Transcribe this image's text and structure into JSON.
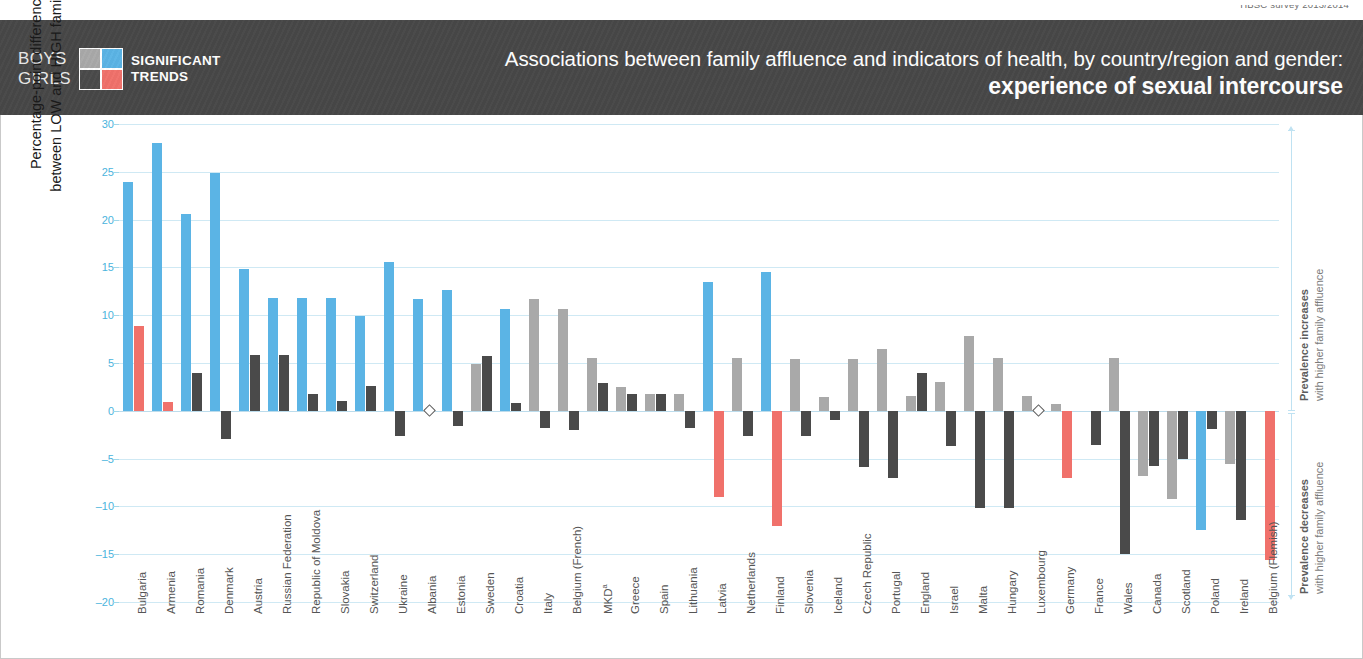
{
  "source": {
    "text": "HBSC survey 2013/2014"
  },
  "header": {
    "legend": {
      "gender_top": "BOYS",
      "gender_bottom": "GIRLS",
      "caption_line1": "SIGNIFICANT",
      "caption_line2": "TRENDS",
      "swatch": {
        "boys_nonsignificant": "#A9A9A9",
        "boys_significant": "#5BB4E5",
        "girls_nonsignificant": "#4A4A4A",
        "girls_significant": "#F0716B"
      }
    },
    "title_line1": "Associations between family affluence and indicators of health, by country/region and gender:",
    "title_line2": "experience of sexual intercourse",
    "background": "#474747"
  },
  "yaxis": {
    "title_line1": "Percentage-point difference in prevalence",
    "title_line2": "between LOW and HIGH family affluence groups",
    "ticks": [
      30,
      25,
      20,
      15,
      10,
      5,
      0,
      -5,
      -10,
      -15,
      -20
    ],
    "tick_labels": [
      "30",
      "25",
      "20",
      "15",
      "10",
      "5",
      "0",
      "–5",
      "–10",
      "–15",
      "–20"
    ],
    "min": -20,
    "max": 30,
    "tick_color": "#4BB4DD"
  },
  "annotations": {
    "increase": {
      "bold": "Prevalence increases",
      "rest": "with higher family affluence"
    },
    "decrease": {
      "bold": "Prevalence decreases",
      "rest": "with higher family affluence"
    }
  },
  "chart_data": {
    "type": "bar",
    "title": "Associations between family affluence and indicators of health, by country/region and gender: experience of sexual intercourse",
    "xlabel": "",
    "ylabel": "Percentage-point difference in prevalence between LOW and HIGH family affluence groups",
    "ylim": [
      -20,
      30
    ],
    "ytick_step": 5,
    "grid": true,
    "legend_position": "header-left",
    "colors": {
      "boys_significant": "#5BB4E5",
      "boys_nonsignificant": "#A9A9A9",
      "girls_significant": "#F0716B",
      "girls_nonsignificant": "#4A4A4A"
    },
    "categories": [
      "Bulgaria",
      "Armenia",
      "Romania",
      "Denmark",
      "Austria",
      "Russian Federation",
      "Republic of Moldova",
      "Slovakia",
      "Switzerland",
      "Ukraine",
      "Albania",
      "Estonia",
      "Sweden",
      "Croatia",
      "Italy",
      "Belgium (French)",
      "MKD",
      "Greece",
      "Spain",
      "Lithuania",
      "Latvia",
      "Netherlands",
      "Finland",
      "Slovenia",
      "Iceland",
      "Czech Republic",
      "Portugal",
      "England",
      "Israel",
      "Malta",
      "Hungary",
      "Luxembourg",
      "Germany",
      "France",
      "Wales",
      "Canada",
      "Scotland",
      "Poland",
      "Ireland",
      "Belgium (Flemish)"
    ],
    "series": [
      {
        "name": "Boys",
        "values": [
          23.9,
          28.0,
          20.6,
          24.9,
          14.8,
          11.8,
          11.8,
          11.8,
          9.9,
          15.6,
          11.7,
          12.6,
          4.9,
          10.6,
          11.7,
          10.6,
          5.5,
          2.5,
          1.8,
          1.8,
          13.5,
          5.5,
          14.5,
          5.4,
          1.4,
          5.4,
          6.5,
          1.5,
          3.0,
          7.8,
          5.5,
          1.5,
          0.7,
          0.0,
          5.5,
          0.0,
          0.0,
          0.0,
          0.0,
          0.0
        ],
        "significance": [
          "sig",
          "sig",
          "sig",
          "sig",
          "sig",
          "sig",
          "sig",
          "sig",
          "sig",
          "sig",
          "sig",
          "sig",
          "ns",
          "sig",
          "ns",
          "ns",
          "ns",
          "ns",
          "ns",
          "ns",
          "sig",
          "ns",
          "sig",
          "ns",
          "ns",
          "ns",
          "ns",
          "ns",
          "ns",
          "ns",
          "ns",
          "ns",
          "ns",
          "ns",
          "ns",
          "ns",
          "ns",
          "ns",
          "ns",
          "ns"
        ]
      },
      {
        "name": "Boys negative",
        "values": [
          0,
          0,
          0,
          0,
          0,
          0,
          0,
          0,
          0,
          0,
          0,
          0,
          0,
          0,
          0,
          0,
          0,
          0,
          0,
          0,
          0,
          0,
          0,
          0,
          0,
          0,
          -5.0,
          -6.5,
          0,
          0,
          0,
          -6.5,
          0,
          0,
          0,
          -6.8,
          -9.2,
          -12.5,
          -5.6,
          0
        ],
        "significance": [
          "ns",
          "ns",
          "ns",
          "ns",
          "ns",
          "ns",
          "ns",
          "ns",
          "ns",
          "ns",
          "ns",
          "ns",
          "ns",
          "ns",
          "ns",
          "ns",
          "ns",
          "ns",
          "ns",
          "ns",
          "ns",
          "ns",
          "ns",
          "ns",
          "ns",
          "ns",
          "ns",
          "ns",
          "ns",
          "ns",
          "ns",
          "ns",
          "ns",
          "ns",
          "ns",
          "ns",
          "ns",
          "sig",
          "ns",
          "ns"
        ]
      },
      {
        "name": "Girls",
        "values": [
          8.9,
          0.9,
          4.0,
          -2.9,
          5.8,
          5.8,
          1.8,
          1.0,
          2.6,
          -2.6,
          0.0,
          -1.6,
          5.7,
          0.8,
          -1.8,
          -2.0,
          2.9,
          1.8,
          1.8,
          -1.8,
          -9.0,
          -2.6,
          -12.0,
          -2.6,
          -1.0,
          -5.9,
          -7.0,
          4.0,
          -3.7,
          -10.2,
          -10.2,
          0.0,
          -7.0,
          -3.6,
          -15.0,
          -5.8,
          -5.0,
          -1.9,
          -11.4,
          -15.6
        ],
        "significance": [
          "sig",
          "sig",
          "ns",
          "ns",
          "ns",
          "ns",
          "ns",
          "ns",
          "ns",
          "ns",
          "marker",
          "ns",
          "ns",
          "ns",
          "ns",
          "ns",
          "ns",
          "ns",
          "ns",
          "ns",
          "sig",
          "ns",
          "sig",
          "ns",
          "ns",
          "ns",
          "ns",
          "ns",
          "ns",
          "ns",
          "ns",
          "ns",
          "sig",
          "ns",
          "ns",
          "ns",
          "ns",
          "ns",
          "ns",
          "sig"
        ]
      }
    ]
  }
}
